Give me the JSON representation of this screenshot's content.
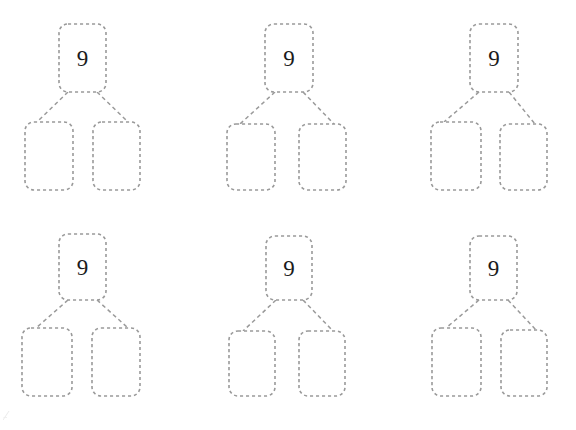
{
  "page": {
    "background_color": "#ffffff",
    "width": 576,
    "height": 430
  },
  "style": {
    "box_stroke_color": "#9a9a9a",
    "box_fill_color": "#ffffff",
    "connector_color": "#9a9a9a",
    "value_text_color": "#1b1b1b",
    "border_style": "dashed",
    "corner_radius": 9
  },
  "grid": {
    "columns": 3,
    "rows": 2,
    "total_bonds": 6
  },
  "bonds": [
    {
      "id": "bond-1",
      "row": 1,
      "column": 1,
      "whole": {
        "label": "9",
        "x": 59,
        "y": 24,
        "width": 47,
        "height": 68
      },
      "parts": [
        {
          "label": "",
          "x": 25,
          "y": 122,
          "width": 48,
          "height": 68
        },
        {
          "label": "",
          "x": 93,
          "y": 122,
          "width": 47,
          "height": 68
        }
      ]
    },
    {
      "id": "bond-2",
      "row": 1,
      "column": 2,
      "whole": {
        "label": "9",
        "x": 265,
        "y": 24,
        "width": 48,
        "height": 68
      },
      "parts": [
        {
          "label": "",
          "x": 227,
          "y": 124,
          "width": 48,
          "height": 66
        },
        {
          "label": "",
          "x": 299,
          "y": 124,
          "width": 47,
          "height": 66
        }
      ]
    },
    {
      "id": "bond-3",
      "row": 1,
      "column": 3,
      "whole": {
        "label": "9",
        "x": 470,
        "y": 24,
        "width": 48,
        "height": 68
      },
      "parts": [
        {
          "label": "",
          "x": 431,
          "y": 122,
          "width": 50,
          "height": 68
        },
        {
          "label": "",
          "x": 500,
          "y": 124,
          "width": 47,
          "height": 66
        }
      ]
    },
    {
      "id": "bond-4",
      "row": 2,
      "column": 1,
      "whole": {
        "label": "9",
        "x": 59,
        "y": 234,
        "width": 47,
        "height": 66
      },
      "parts": [
        {
          "label": "",
          "x": 22,
          "y": 328,
          "width": 50,
          "height": 68
        },
        {
          "label": "",
          "x": 92,
          "y": 328,
          "width": 48,
          "height": 68
        }
      ]
    },
    {
      "id": "bond-5",
      "row": 2,
      "column": 2,
      "whole": {
        "label": "9",
        "x": 266,
        "y": 236,
        "width": 46,
        "height": 64
      },
      "parts": [
        {
          "label": "",
          "x": 229,
          "y": 331,
          "width": 46,
          "height": 65
        },
        {
          "label": "",
          "x": 299,
          "y": 331,
          "width": 46,
          "height": 65
        }
      ]
    },
    {
      "id": "bond-6",
      "row": 2,
      "column": 3,
      "whole": {
        "label": "9",
        "x": 470,
        "y": 236,
        "width": 47,
        "height": 64
      },
      "parts": [
        {
          "label": "",
          "x": 432,
          "y": 328,
          "width": 49,
          "height": 68
        },
        {
          "label": "",
          "x": 501,
          "y": 330,
          "width": 46,
          "height": 66
        }
      ]
    }
  ]
}
